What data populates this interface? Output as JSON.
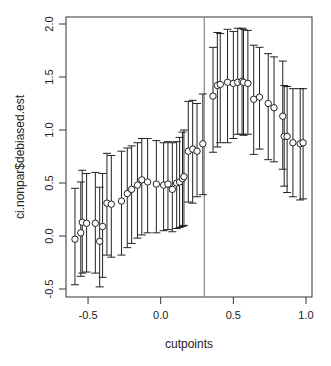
{
  "chart_data": {
    "type": "scatter",
    "subtype": "point_with_error_bars",
    "title": "",
    "xlabel": "cutpoints",
    "ylabel": "ci.nonpar$debiased.est",
    "xlim": [
      -0.63,
      1.04
    ],
    "ylim": [
      -0.57,
      2.07
    ],
    "xticks": [
      -0.5,
      0.0,
      0.5,
      1.0
    ],
    "xtick_labels": [
      "-0.5",
      "0.0",
      "0.5",
      "1.0"
    ],
    "yticks": [
      -0.5,
      0.0,
      0.5,
      1.0,
      1.5,
      2.0
    ],
    "ytick_labels": [
      "-0.5",
      "0.0",
      "0.5",
      "1.0",
      "1.5",
      "2.0"
    ],
    "grid": false,
    "legend": null,
    "vline": {
      "x": 0.3,
      "color": "#8c8c8c"
    },
    "points": [
      {
        "x": -0.59,
        "y": -0.03,
        "lo": -0.46,
        "hi": 0.45
      },
      {
        "x": -0.55,
        "y": 0.03,
        "lo": -0.38,
        "hi": 0.51
      },
      {
        "x": -0.54,
        "y": 0.13,
        "lo": -0.35,
        "hi": 0.62
      },
      {
        "x": -0.51,
        "y": 0.12,
        "lo": -0.34,
        "hi": 0.59
      },
      {
        "x": -0.45,
        "y": 0.12,
        "lo": -0.35,
        "hi": 0.6
      },
      {
        "x": -0.42,
        "y": -0.05,
        "lo": -0.48,
        "hi": 0.46
      },
      {
        "x": -0.4,
        "y": 0.09,
        "lo": -0.39,
        "hi": 0.59
      },
      {
        "x": -0.37,
        "y": 0.31,
        "lo": -0.18,
        "hi": 0.78
      },
      {
        "x": -0.34,
        "y": 0.3,
        "lo": -0.2,
        "hi": 0.76
      },
      {
        "x": -0.27,
        "y": 0.33,
        "lo": -0.18,
        "hi": 0.8
      },
      {
        "x": -0.23,
        "y": 0.4,
        "lo": -0.11,
        "hi": 0.83
      },
      {
        "x": -0.2,
        "y": 0.44,
        "lo": -0.07,
        "hi": 0.85
      },
      {
        "x": -0.16,
        "y": 0.48,
        "lo": -0.02,
        "hi": 0.88
      },
      {
        "x": -0.13,
        "y": 0.53,
        "lo": 0.01,
        "hi": 0.92
      },
      {
        "x": -0.09,
        "y": 0.51,
        "lo": 0.03,
        "hi": 0.92
      },
      {
        "x": -0.03,
        "y": 0.49,
        "lo": 0.03,
        "hi": 0.9
      },
      {
        "x": 0.02,
        "y": 0.48,
        "lo": 0.05,
        "hi": 0.88
      },
      {
        "x": 0.05,
        "y": 0.49,
        "lo": 0.06,
        "hi": 0.89
      },
      {
        "x": 0.08,
        "y": 0.44,
        "lo": 0.04,
        "hi": 0.88
      },
      {
        "x": 0.11,
        "y": 0.5,
        "lo": 0.07,
        "hi": 0.89
      },
      {
        "x": 0.13,
        "y": 0.51,
        "lo": 0.08,
        "hi": 0.93
      },
      {
        "x": 0.15,
        "y": 0.54,
        "lo": 0.09,
        "hi": 0.98
      },
      {
        "x": 0.16,
        "y": 0.56,
        "lo": 0.1,
        "hi": 1.0
      },
      {
        "x": 0.19,
        "y": 0.8,
        "lo": 0.32,
        "hi": 1.27
      },
      {
        "x": 0.22,
        "y": 0.82,
        "lo": 0.31,
        "hi": 1.28
      },
      {
        "x": 0.25,
        "y": 0.8,
        "lo": 0.37,
        "hi": 1.25
      },
      {
        "x": 0.29,
        "y": 0.87,
        "lo": 0.39,
        "hi": 1.34
      },
      {
        "x": 0.36,
        "y": 1.32,
        "lo": 0.79,
        "hi": 1.78
      },
      {
        "x": 0.39,
        "y": 1.42,
        "lo": 0.84,
        "hi": 1.92
      },
      {
        "x": 0.41,
        "y": 1.43,
        "lo": 0.88,
        "hi": 1.91
      },
      {
        "x": 0.46,
        "y": 1.45,
        "lo": 0.88,
        "hi": 1.95
      },
      {
        "x": 0.5,
        "y": 1.44,
        "lo": 0.92,
        "hi": 1.93
      },
      {
        "x": 0.53,
        "y": 1.45,
        "lo": 0.96,
        "hi": 1.96
      },
      {
        "x": 0.56,
        "y": 1.46,
        "lo": 0.96,
        "hi": 1.96
      },
      {
        "x": 0.57,
        "y": 1.45,
        "lo": 0.95,
        "hi": 1.95
      },
      {
        "x": 0.6,
        "y": 1.44,
        "lo": 0.96,
        "hi": 1.94
      },
      {
        "x": 0.64,
        "y": 1.29,
        "lo": 0.77,
        "hi": 1.8
      },
      {
        "x": 0.68,
        "y": 1.31,
        "lo": 0.82,
        "hi": 1.78
      },
      {
        "x": 0.74,
        "y": 1.25,
        "lo": 0.72,
        "hi": 1.72
      },
      {
        "x": 0.78,
        "y": 1.21,
        "lo": 0.7,
        "hi": 1.69
      },
      {
        "x": 0.84,
        "y": 1.13,
        "lo": 0.63,
        "hi": 1.65
      },
      {
        "x": 0.85,
        "y": 0.94,
        "lo": 0.47,
        "hi": 1.42
      },
      {
        "x": 0.87,
        "y": 0.94,
        "lo": 0.41,
        "hi": 1.41
      },
      {
        "x": 0.91,
        "y": 0.88,
        "lo": 0.37,
        "hi": 1.39
      },
      {
        "x": 0.96,
        "y": 0.87,
        "lo": 0.34,
        "hi": 1.39
      },
      {
        "x": 0.98,
        "y": 0.88,
        "lo": 0.35,
        "hi": 1.39
      }
    ]
  },
  "style": {
    "axis_color": "#333333",
    "errorbar_color": "#222222",
    "point_stroke": "#222222",
    "point_fill": "#ffffff",
    "vline_color": "#8c8c8c"
  }
}
